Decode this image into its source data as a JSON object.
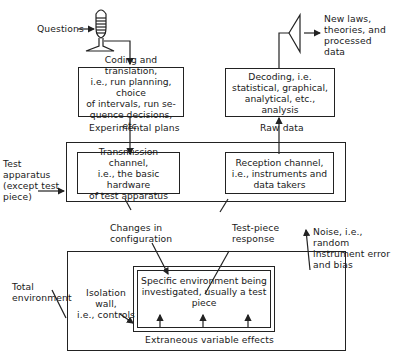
{
  "diagram": {
    "input_label": "Questions",
    "output_label": "New laws,\ntheories, and\nprocessed\ndata",
    "boxes": {
      "coding": "Coding and translation,\ni.e., run planning, choice\nof intervals, run se-\nquence decisions, etc.",
      "decoding": "Decoding, i.e.\nstatistical, graphical,\nanalytical, etc., analysis",
      "transmission": "Transmission channel,\ni.e., the basic hardware\nof test apparatus",
      "reception": "Reception channel,\ni.e., instruments and\ndata takers",
      "specific_env": "Specific environment being\ninvestigated, usually a test\npiece"
    },
    "flow_labels": {
      "experimental_plans": "Experimental plans",
      "raw_data": "Raw data",
      "changes_config": "Changes in\nconfiguration",
      "test_piece_response": "Test-piece\nresponse",
      "noise": "Noise, i.e., random\ninstrument error\nand bias",
      "extraneous": "Extraneous variable effects"
    },
    "region_labels": {
      "test_apparatus": "Test\napparatus\n(except test\npiece)",
      "total_environment": "Total\nenvironment",
      "isolation_wall": "Isolation\nwall,\ni.e., controls"
    },
    "colors": {
      "line": "#222222",
      "background": "#ffffff"
    }
  }
}
